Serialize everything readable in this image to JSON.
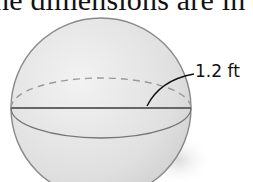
{
  "caption": {
    "text": "he dimensions are in"
  },
  "figure": {
    "shape": "sphere",
    "radius_label": "1.2 ft",
    "colors": {
      "sphere_fill": "#e4e4e4",
      "outline": "#8a8a8a",
      "equator_line": "#666666",
      "dashed_back": "#9a9a9a",
      "leader": "#111111"
    }
  }
}
